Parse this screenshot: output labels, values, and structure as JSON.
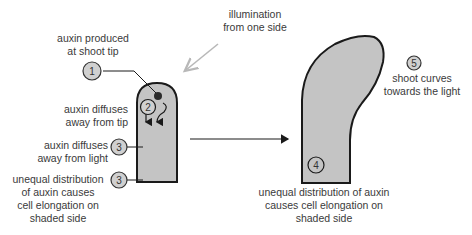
{
  "diagram": {
    "type": "phototropism-process",
    "colors": {
      "shoot_fill": "#c4c4c4",
      "outline": "#1a1a1a",
      "light_arrow": "#b8b8b8",
      "step_circle_fill": "#d0d0d0",
      "text": "#3a3a3a"
    },
    "labels": {
      "illumination": [
        "illumination",
        "from one side"
      ],
      "step1": [
        "auxin produced",
        "at shoot tip"
      ],
      "step2": [
        "auxin diffuses",
        "away from tip"
      ],
      "step3a": [
        "auxin diffuses",
        "away from light"
      ],
      "step3b": [
        "unequal distribution",
        "of auxin causes",
        "cell elongation on",
        "shaded side"
      ],
      "step4": [
        "unequal distribution of auxin",
        "causes cell elongation on",
        "shaded side"
      ],
      "step5": [
        "shoot curves",
        "towards the light"
      ]
    },
    "step_numbers": {
      "s1": "1",
      "s2": "2",
      "s3a": "3",
      "s3b": "3",
      "s4": "4",
      "s5": "5"
    }
  }
}
